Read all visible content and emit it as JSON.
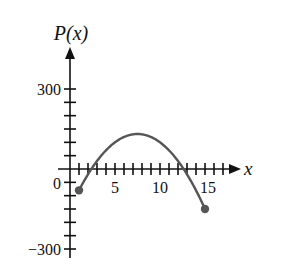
{
  "chart_data": {
    "type": "line",
    "title": "",
    "xlabel": "x",
    "ylabel": "P(x)",
    "function": "P(x) = -5x^2 + 75x - 150",
    "domain": [
      1,
      15
    ],
    "xlim": [
      0,
      18
    ],
    "ylim": [
      -300,
      300
    ],
    "x_tick_labels": [
      "5",
      "10",
      "15"
    ],
    "y_tick_labels": [
      "300",
      "0",
      "−300"
    ],
    "x_minor_tick_step": 1,
    "y_minor_tick_step": 50,
    "grid": false,
    "legend": null,
    "endpoints": [
      {
        "x": 1,
        "y": -80,
        "marker": "filled-circle"
      },
      {
        "x": 15,
        "y": -150,
        "marker": "filled-circle"
      }
    ],
    "series": [
      {
        "name": "P(x)",
        "color": "#555555",
        "x": [
          1,
          2,
          3,
          4,
          5,
          6,
          7,
          7.5,
          8,
          9,
          10,
          11,
          12,
          13,
          14,
          15
        ],
        "y": [
          -80,
          -20,
          30,
          70,
          100,
          120,
          130,
          131.25,
          130,
          120,
          100,
          70,
          30,
          -20,
          -80,
          -150
        ]
      }
    ]
  },
  "labels": {
    "y_axis": "P(x)",
    "x_axis": "x",
    "y300": "300",
    "y0": "0",
    "yneg300": "−300",
    "x5": "5",
    "x10": "10",
    "x15": "15"
  },
  "colors": {
    "axis": "#111111",
    "curve": "#555555",
    "background": "#ffffff"
  }
}
